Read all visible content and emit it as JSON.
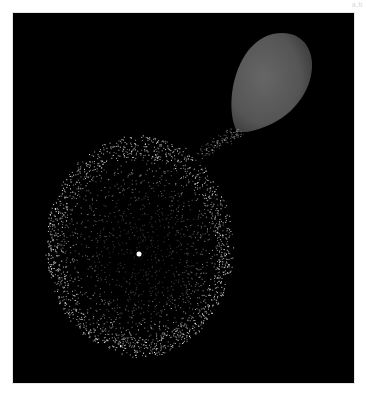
{
  "figure": {
    "panel_label": "a,b",
    "background": "#000000",
    "frame": {
      "x": 13,
      "y": 13,
      "width": 341,
      "height": 370
    },
    "balloon": {
      "description": "grey balloon",
      "color": "#5a5a5a",
      "center": [
        277,
        83
      ],
      "rx": 45,
      "ry": 50,
      "tip": [
        237,
        132
      ]
    },
    "particle_cloud": {
      "description": "expanding ring of bright particles around central point",
      "center": [
        139,
        254
      ],
      "outer_rx": 93,
      "outer_ry": 110,
      "ring_brightness_color": "#ffffff",
      "particle_count": 2600
    },
    "center_point": {
      "x": 139,
      "y": 254,
      "radius": 2.5,
      "color": "#ffffff"
    }
  }
}
